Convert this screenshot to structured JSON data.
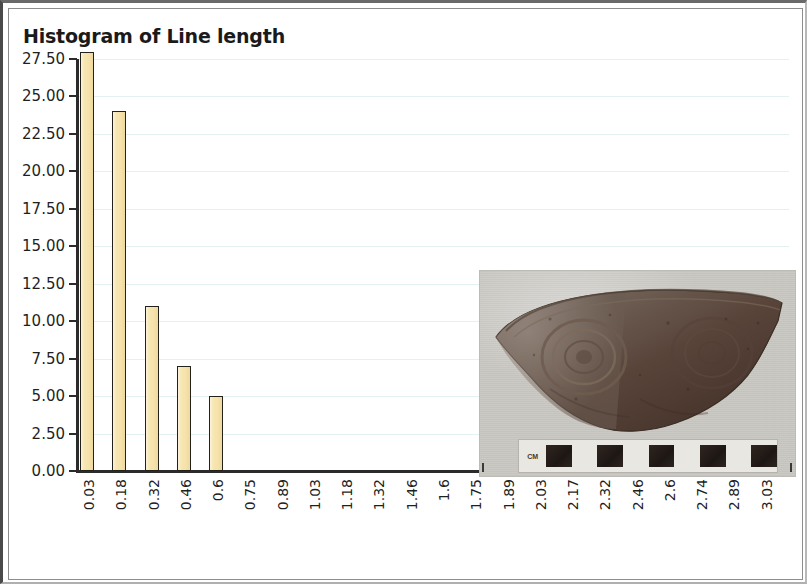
{
  "chart_data": {
    "type": "bar",
    "title": "Histogram of Line length",
    "xlabel": "",
    "ylabel": "",
    "grid": true,
    "legend": "none",
    "ylim": [
      0.0,
      27.5
    ],
    "ytick_labels": [
      "27.50",
      "25.00",
      "22.50",
      "20.00",
      "17.50",
      "15.00",
      "12.50",
      "10.00",
      "7.50",
      "5.00",
      "2.50",
      "0.00"
    ],
    "ytick_values": [
      27.5,
      25.0,
      22.5,
      20.0,
      17.5,
      15.0,
      12.5,
      10.0,
      7.5,
      5.0,
      2.5,
      0.0
    ],
    "categories": [
      "0.03",
      "0.18",
      "0.32",
      "0.46",
      "0.6",
      "0.75",
      "0.89",
      "1.03",
      "1.18",
      "1.32",
      "1.46",
      "1.6",
      "1.75",
      "1.89",
      "2.03",
      "2.17",
      "2.32",
      "2.46",
      "2.6",
      "2.74",
      "2.89",
      "3.03"
    ],
    "values": [
      28,
      24,
      11,
      7,
      5,
      0,
      0,
      0,
      0,
      0,
      0,
      0,
      0,
      0,
      0,
      0,
      0,
      0,
      0,
      0,
      0,
      0
    ],
    "bar_fill_color": "#f6e3ab",
    "bar_outline_color": "#23211c",
    "gridline_color": "#e3f2f0",
    "axis_color": "#2b2b2b"
  },
  "photo": {
    "subject": "pottery-sherd",
    "scale_label": "CM",
    "scale_segments": 5
  }
}
